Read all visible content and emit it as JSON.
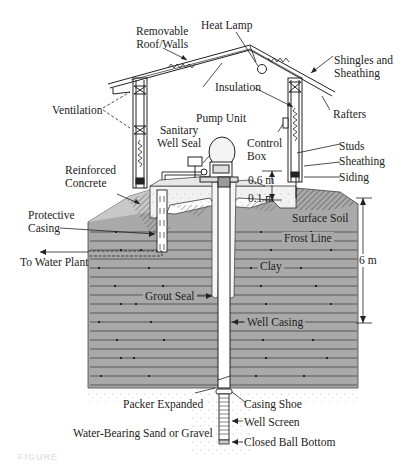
{
  "labels": {
    "removable_roof_walls": [
      "Removable",
      "Roof/Walls"
    ],
    "heat_lamp": "Heat Lamp",
    "shingles_sheathing": [
      "Shingles and",
      "Sheathing"
    ],
    "insulation": "Insulation",
    "rafters": "Rafters",
    "ventilation": "Ventilation",
    "pump_unit": "Pump Unit",
    "sanitary_well_seal": [
      "Sanitary",
      "Well Seal"
    ],
    "control_box": [
      "Control",
      "Box"
    ],
    "studs": "Studs",
    "sheathing": "Sheathing",
    "siding": "Siding",
    "reinforced_concrete": [
      "Reinforced",
      "Concrete"
    ],
    "dim_06": "0.6 m",
    "dim_01": "0.1 m",
    "surface_soil": "Surface Soil",
    "protective_casing": [
      "Protective",
      "Casing"
    ],
    "frost_line": "Frost Line",
    "to_water_plant": "To Water Plant",
    "clay": "Clay",
    "dim_6m": "6 m",
    "grout_seal": "Grout Seal",
    "well_casing": "Well Casing",
    "packer_expanded": "Packer Expanded",
    "casing_shoe": "Casing Shoe",
    "well_screen": "Well Screen",
    "water_bearing": "Water-Bearing Sand or Gravel",
    "closed_ball_bottom": "Closed Ball Bottom"
  },
  "caption": "FIGURE",
  "colors": {
    "clay": "#a9a9a9",
    "stroke": "#2a2a2a",
    "concrete": "#f2f2f2",
    "hatch": "#555555"
  }
}
